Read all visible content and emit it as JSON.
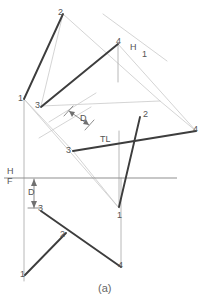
{
  "figure": {
    "caption": "(a)",
    "colors": {
      "heavy_line": "#3a3a3a",
      "light_line": "#c2c2c2",
      "medium_line": "#9a9a9a",
      "projector": "#b5b5b5",
      "text": "#555555",
      "background": "#ffffff"
    },
    "canvas": {
      "width": 211,
      "height": 301
    }
  },
  "labels": [
    {
      "id": "top-point-2",
      "text": "2",
      "x": 58,
      "y": 8
    },
    {
      "id": "top-point-4",
      "text": "4",
      "x": 116,
      "y": 37
    },
    {
      "id": "fold-h1-h",
      "text": "H",
      "x": 130,
      "y": 43
    },
    {
      "id": "fold-h1-1",
      "text": "1",
      "x": 141,
      "y": 49
    },
    {
      "id": "top-point-1",
      "text": "1",
      "x": 19,
      "y": 95
    },
    {
      "id": "top-point-3",
      "text": "3",
      "x": 35,
      "y": 101
    },
    {
      "id": "aux-dimension-d",
      "text": "D",
      "x": 82,
      "y": 116
    },
    {
      "id": "aux-point-2",
      "text": "2",
      "x": 143,
      "y": 111
    },
    {
      "id": "true-length-label",
      "text": "TL",
      "x": 101,
      "y": 136
    },
    {
      "id": "aux-point-4",
      "text": "4",
      "x": 193,
      "y": 126
    },
    {
      "id": "aux-point-3",
      "text": "3",
      "x": 68,
      "y": 146
    },
    {
      "id": "fold-hf-h",
      "text": "H",
      "x": 8,
      "y": 168
    },
    {
      "id": "fold-hf-f",
      "text": "F",
      "x": 8,
      "y": 177
    },
    {
      "id": "front-dimension-d",
      "text": "D",
      "x": 29,
      "y": 189
    },
    {
      "id": "front-point-3",
      "text": "3",
      "x": 37,
      "y": 206
    },
    {
      "id": "front-point-1",
      "text": "1",
      "x": 116,
      "y": 212
    },
    {
      "id": "front-point-2",
      "text": "2",
      "x": 60,
      "y": 231
    },
    {
      "id": "front-point-4",
      "text": "4",
      "x": 117,
      "y": 262
    },
    {
      "id": "front-point-1-left",
      "text": "1",
      "x": 21,
      "y": 271
    }
  ],
  "geometry": {
    "heavy_polylines": [
      {
        "id": "top-view-1-2",
        "points": "24,99 63,14"
      },
      {
        "id": "top-view-3-4",
        "points": "41,106 118,44"
      },
      {
        "id": "aux-line-3-4",
        "points": "73,151 196,131"
      },
      {
        "id": "aux-line-2-1",
        "points": "140,117 119,207"
      },
      {
        "id": "front-view-3-2-4",
        "points": "41,211 121,267"
      },
      {
        "id": "front-view-1-2",
        "points": "25,274 66,233"
      }
    ],
    "light_polylines": [
      {
        "id": "top-projector-2-right",
        "points": "63,14 159,100"
      },
      {
        "id": "top-view-4-edge",
        "points": "118,44 196,131"
      },
      {
        "id": "aux-fold-line-h1",
        "points": "103,14 166,60"
      },
      {
        "id": "aux-frame-1-3",
        "points": "24,99 73,151"
      },
      {
        "id": "aux-frame-upper",
        "points": "41,106 159,100"
      },
      {
        "id": "aux-dim-rail-a",
        "points": "48,120 95,93"
      },
      {
        "id": "aux-dim-rail-b",
        "points": "40,137 90,108"
      },
      {
        "id": "aux-frame-diag",
        "points": "63,14 41,106"
      },
      {
        "id": "aux-frame-right",
        "points": "159,100 196,131"
      },
      {
        "id": "aux-to-front-left",
        "points": "24,99 24,281"
      },
      {
        "id": "aux-to-front-ray",
        "points": "41,106 119,207"
      },
      {
        "id": "aux-long-ray",
        "points": "73,151 119,207"
      },
      {
        "id": "aux-diag-long",
        "points": "118,44 41,106"
      },
      {
        "id": "projector-4-vert",
        "points": "118,44 118,80"
      },
      {
        "id": "projector-2-vert",
        "points": "119,131 119,207"
      },
      {
        "id": "front-projector-4",
        "points": "121,180 121,267"
      },
      {
        "id": "front-dim-vert",
        "points": "34,178 34,209"
      }
    ],
    "fold_line_hf": {
      "id": "fold-line-h-f",
      "points": "4,178 176,178"
    },
    "dim_arrows": [
      {
        "id": "aux-d-arrow",
        "from": "68,110",
        "to": "88,124"
      },
      {
        "id": "front-d-arrow",
        "from": "34,180",
        "to": "34,207"
      }
    ]
  }
}
